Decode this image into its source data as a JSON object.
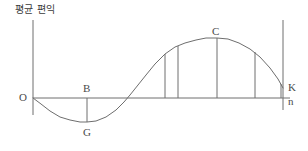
{
  "figure": {
    "name": "average-benefit-curve",
    "y_axis_caption": "평균 편익",
    "background_color": "#ffffff",
    "line_color": "#6e6e6e",
    "text_color": "#4a4a4a"
  },
  "labels": {
    "origin": "O",
    "b_point": "B",
    "g_point": "G",
    "c_point": "C",
    "k_point": "K",
    "n_point": "n"
  },
  "chart_data": {
    "type": "line",
    "title": "",
    "subtitle": "",
    "xlabel": "",
    "ylabel": "평균 편익",
    "grid": false,
    "legend": null,
    "xlim": [
      0,
      308
    ],
    "ylim": [
      0,
      151
    ],
    "axes": {
      "y_axis": {
        "x": 33,
        "y_top": 20,
        "y_bottom": 115
      },
      "x_axis": {
        "y": 98,
        "x_start": 33,
        "x_end": 290
      },
      "right_vertical": {
        "x": 283,
        "y_top": 20,
        "y_bottom": 110
      }
    },
    "curve": {
      "name": "average-benefit",
      "description": "sine-like wave starting at origin, dipping below axis, rising to a peak, then descending",
      "points": [
        [
          33,
          98
        ],
        [
          41,
          104
        ],
        [
          50,
          111
        ],
        [
          60,
          117
        ],
        [
          70,
          120
        ],
        [
          80,
          122
        ],
        [
          87,
          122
        ],
        [
          96,
          121
        ],
        [
          106,
          117
        ],
        [
          116,
          110
        ],
        [
          124,
          102
        ],
        [
          130,
          95
        ],
        [
          138,
          85
        ],
        [
          146,
          75
        ],
        [
          155,
          64
        ],
        [
          165,
          54
        ],
        [
          175,
          47
        ],
        [
          185,
          43
        ],
        [
          196,
          40
        ],
        [
          206,
          38
        ],
        [
          217,
          38
        ],
        [
          228,
          39
        ],
        [
          239,
          43
        ],
        [
          250,
          49
        ],
        [
          260,
          57
        ],
        [
          270,
          68
        ],
        [
          278,
          79
        ],
        [
          283,
          88
        ]
      ]
    },
    "annotations": [
      {
        "label": "O",
        "x": 33,
        "y": 98,
        "role": "origin"
      },
      {
        "label": "B",
        "x": 87,
        "y": 98,
        "role": "axis-intersection"
      },
      {
        "label": "G",
        "x": 87,
        "y": 122,
        "role": "curve-minimum"
      },
      {
        "label": "C",
        "x": 217,
        "y": 38,
        "role": "curve-maximum"
      },
      {
        "label": "K",
        "x": 283,
        "y": 88,
        "role": "curve-endpoint"
      },
      {
        "label": "n",
        "x": 290,
        "y": 98,
        "role": "x-axis-endpoint"
      }
    ],
    "drop_lines": [
      {
        "x": 87,
        "y_from": 98,
        "y_to": 122,
        "direction": "down",
        "name": "bg-segment"
      },
      {
        "x": 165,
        "y_from": 98,
        "y_to": 54,
        "direction": "up",
        "name": "ordinate-1"
      },
      {
        "x": 178,
        "y_from": 98,
        "y_to": 46,
        "direction": "up",
        "name": "ordinate-2"
      },
      {
        "x": 217,
        "y_from": 98,
        "y_to": 38,
        "direction": "up",
        "name": "ordinate-3"
      },
      {
        "x": 255,
        "y_from": 98,
        "y_to": 52,
        "direction": "up",
        "name": "ordinate-4"
      },
      {
        "x": 281,
        "y_from": 98,
        "y_to": 84,
        "direction": "up",
        "name": "ordinate-5"
      }
    ]
  }
}
